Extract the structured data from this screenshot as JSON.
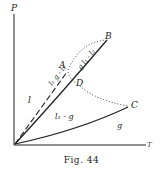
{
  "figure": {
    "caption": "Fig. 44",
    "axes": {
      "y_label": "P",
      "x_label": "T"
    },
    "points": {
      "A": "A",
      "B": "B",
      "C": "C",
      "D": "D"
    },
    "regions": {
      "liquid": "l",
      "gas": "g",
      "l1_g": "l₁ - g",
      "l1_g_l2": "l₁ g - l₂",
      "g_l1_l2": "g l₁ - l₂"
    },
    "colors": {
      "ink": "#222222",
      "background": "#ffffff"
    }
  }
}
